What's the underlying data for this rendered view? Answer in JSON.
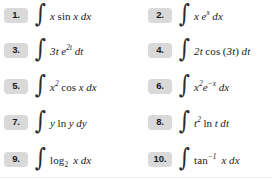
{
  "page": {
    "type": "math-exercise-list",
    "columns": 2,
    "rows": 5,
    "total_items": 10,
    "badge_color": "#d9d9d9",
    "text_color": "#1a1a1a",
    "background_color": "#ffffff"
  },
  "exercises": [
    {
      "number": "1.",
      "integrand_plain": "x sin x dx",
      "variable": "x"
    },
    {
      "number": "2.",
      "integrand_plain": "x e^x dx",
      "variable": "x"
    },
    {
      "number": "3.",
      "integrand_plain": "3t e^{2t} dt",
      "variable": "t"
    },
    {
      "number": "4.",
      "integrand_plain": "2t cos (3t) dt",
      "variable": "t"
    },
    {
      "number": "5.",
      "integrand_plain": "x^2 cos x dx",
      "variable": "x"
    },
    {
      "number": "6.",
      "integrand_plain": "x^2 e^{-x} dx",
      "variable": "x"
    },
    {
      "number": "7.",
      "integrand_plain": "y ln y dy",
      "variable": "y"
    },
    {
      "number": "8.",
      "integrand_plain": "t^2 ln t dt",
      "variable": "t"
    },
    {
      "number": "9.",
      "integrand_plain": "log_2 x dx",
      "variable": "x"
    },
    {
      "number": "10.",
      "integrand_plain": "tan^{-1} x dx",
      "variable": "x"
    }
  ],
  "symbols": {
    "integral": "∫"
  }
}
